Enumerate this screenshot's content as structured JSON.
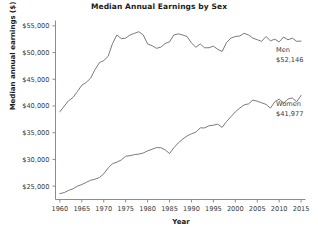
{
  "chart_data": {
    "type": "line",
    "title": "Median Annual Earnings by Sex",
    "xlabel": "Year",
    "ylabel": "Median annual earnings ($)",
    "xlim": [
      1959,
      2016
    ],
    "ylim": [
      22500,
      56000
    ],
    "grid": false,
    "legend_position": "inline-right-annotations",
    "x_ticks": [
      1960,
      1965,
      1970,
      1975,
      1980,
      1985,
      1990,
      1995,
      2000,
      2005,
      2010,
      2015
    ],
    "x_tick_labels": [
      "1960",
      "1965",
      "1970",
      "1975",
      "1980",
      "1985",
      "1990",
      "1995",
      "2000",
      "2005",
      "2010",
      "2015"
    ],
    "y_ticks": [
      25000,
      30000,
      35000,
      40000,
      45000,
      50000,
      55000
    ],
    "y_tick_labels": [
      "$25,000",
      "$30,000",
      "$35,000",
      "$40,000",
      "$45,000",
      "$50,000",
      "$55,000"
    ],
    "x": [
      1960,
      1961,
      1962,
      1963,
      1964,
      1965,
      1966,
      1967,
      1968,
      1969,
      1970,
      1971,
      1972,
      1973,
      1974,
      1975,
      1976,
      1977,
      1978,
      1979,
      1980,
      1981,
      1982,
      1983,
      1984,
      1985,
      1986,
      1987,
      1988,
      1989,
      1990,
      1991,
      1992,
      1993,
      1994,
      1995,
      1996,
      1997,
      1998,
      1999,
      2000,
      2001,
      2002,
      2003,
      2004,
      2005,
      2006,
      2007,
      2008,
      2009,
      2010,
      2011,
      2012,
      2013,
      2014,
      2015
    ],
    "series": [
      {
        "name": "Men",
        "color": "#6b6b6b",
        "end_label": "Men",
        "end_value_label": "$52,146",
        "end_value": 52146,
        "values": [
          38900,
          40000,
          41000,
          41600,
          42700,
          43900,
          44400,
          45200,
          46800,
          48100,
          48500,
          49300,
          51700,
          53300,
          52600,
          52700,
          53300,
          53600,
          53900,
          53300,
          51600,
          51300,
          50800,
          51000,
          51700,
          52000,
          53300,
          53500,
          53300,
          53000,
          51800,
          51000,
          51600,
          50900,
          50900,
          51200,
          50600,
          50200,
          51900,
          52700,
          53000,
          53100,
          53600,
          53300,
          52700,
          52400,
          52100,
          53000,
          52200,
          52500,
          52000,
          52900,
          52400,
          52700,
          52100,
          52146
        ]
      },
      {
        "name": "Women",
        "color": "#6b6b6b",
        "end_label": "Women",
        "end_value_label": "$41,977",
        "end_value": 41977,
        "values": [
          23600,
          23800,
          24200,
          24500,
          25000,
          25300,
          25700,
          26100,
          26300,
          26600,
          27300,
          28400,
          29200,
          29500,
          29900,
          30600,
          30700,
          30900,
          31000,
          31200,
          31600,
          31900,
          32200,
          32200,
          31800,
          31100,
          32200,
          33100,
          33800,
          34400,
          34800,
          35100,
          35900,
          35900,
          36300,
          36400,
          36600,
          36000,
          37100,
          38000,
          38900,
          39600,
          40200,
          40400,
          41100,
          40900,
          40600,
          40300,
          39600,
          40800,
          41300,
          40500,
          41300,
          41500,
          40800,
          41977
        ]
      }
    ],
    "annotations": [
      {
        "text": "Men",
        "value_text": "$52,146",
        "x": 2015,
        "y": 52146
      },
      {
        "text": "Women",
        "value_text": "$41,977",
        "x": 2015,
        "y": 41977
      }
    ]
  }
}
